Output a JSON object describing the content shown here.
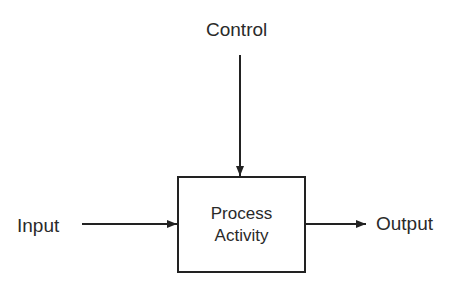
{
  "diagram": {
    "control_label": "Control",
    "input_label": "Input",
    "output_label": "Output",
    "process": {
      "line1": "Process",
      "line2": "Activity"
    }
  }
}
